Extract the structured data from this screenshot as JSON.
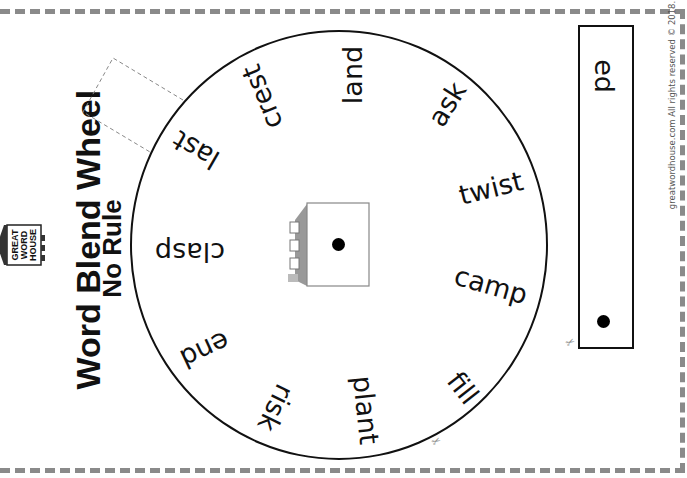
{
  "worksheet": {
    "title": "Word Blend Wheel",
    "subtitle": "No Rule",
    "logo_text": [
      "GREAT",
      "WORD",
      "HOUSE"
    ],
    "copyright": "greatwordhouse.com All rights reserved © 2018."
  },
  "wheel": {
    "words": [
      {
        "text": "land"
      },
      {
        "text": "ask"
      },
      {
        "text": "twist"
      },
      {
        "text": "camp"
      },
      {
        "text": "fill"
      },
      {
        "text": "plant"
      },
      {
        "text": "risk"
      },
      {
        "text": "end"
      },
      {
        "text": "clasp"
      },
      {
        "text": "last"
      },
      {
        "text": "crest"
      }
    ]
  },
  "strip": {
    "ending": "ed"
  },
  "icons": {
    "scissor": "✂"
  },
  "colors": {
    "ink": "#111111",
    "cut_line": "#8a8a8a"
  }
}
